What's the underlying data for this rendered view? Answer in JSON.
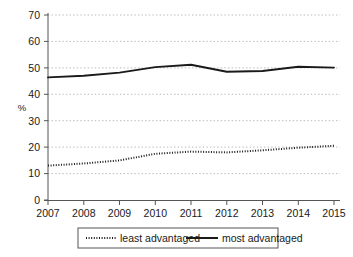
{
  "chart_data": {
    "type": "line",
    "title": "",
    "xlabel": "",
    "ylabel": "%",
    "x": [
      2007,
      2008,
      2009,
      2010,
      2011,
      2012,
      2013,
      2014,
      2015
    ],
    "categories": [
      "2007",
      "2008",
      "2009",
      "2010",
      "2011",
      "2012",
      "2013",
      "2014",
      "2015"
    ],
    "xlim": [
      2007,
      2015
    ],
    "ylim": [
      0,
      70
    ],
    "ytick_labels": [
      "0",
      "10",
      "20",
      "30",
      "40",
      "50",
      "60",
      "70"
    ],
    "yticks": [
      0,
      10,
      20,
      30,
      40,
      50,
      60,
      70
    ],
    "grid": "horizontal-dotted",
    "legend_position": "below-centre",
    "series": [
      {
        "name": "least advantaged",
        "style": "dotted",
        "color": "#1a1a1a",
        "values": [
          13,
          13.8,
          15,
          17.5,
          18.3,
          18,
          18.8,
          19.8,
          20.5
        ]
      },
      {
        "name": "most advantaged",
        "style": "solid",
        "color": "#1a1a1a",
        "values": [
          46.4,
          47,
          48.2,
          50.3,
          51.2,
          48.5,
          48.8,
          50.4,
          50.1
        ]
      }
    ]
  },
  "legend": {
    "items": [
      {
        "label": "least advantaged",
        "style": "dotted"
      },
      {
        "label": "most advantaged",
        "style": "solid"
      }
    ]
  },
  "axis": {
    "y_title": "%"
  }
}
